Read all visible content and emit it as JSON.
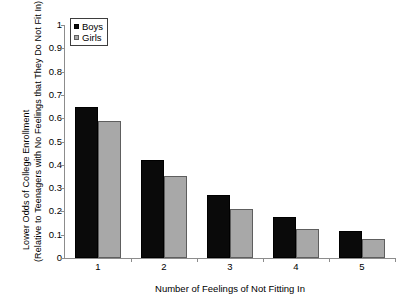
{
  "chart_data": {
    "type": "bar",
    "title": "",
    "subtitle": "",
    "xlabel": "Number of Feelings of Not Fitting In",
    "ylabel_line1": "Lower Odds of College Enrollment",
    "ylabel_line2": "(Relative to Teenagers with No  Feelings that They Do Not Fit In)",
    "categories": [
      "1",
      "2",
      "3",
      "4",
      "5"
    ],
    "series": [
      {
        "name": "Boys",
        "color": "#0a0a0a",
        "values": [
          0.65,
          0.42,
          0.27,
          0.175,
          0.115
        ]
      },
      {
        "name": "Girls",
        "color": "#a8a8a8",
        "values": [
          0.59,
          0.35,
          0.21,
          0.125,
          0.08
        ]
      }
    ],
    "ylim": [
      0,
      1
    ],
    "ytick_labels": [
      "1",
      "0.9",
      "0.8",
      "0.7",
      "0.6",
      "0.5",
      "0.4",
      "0.3",
      "0.2",
      "0.1",
      "0"
    ],
    "ytick_values": [
      1,
      0.9,
      0.8,
      0.7,
      0.6,
      0.5,
      0.4,
      0.3,
      0.2,
      0.1,
      0
    ],
    "grid": false,
    "legend_position": "top-left",
    "legend_entries": [
      "Boys",
      "Girls"
    ]
  }
}
